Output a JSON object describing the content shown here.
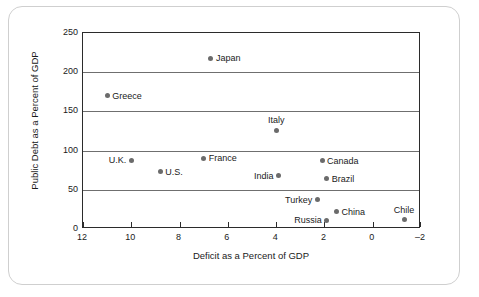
{
  "chart_data": {
    "type": "scatter",
    "title": "",
    "xlabel": "Deficit as a Percent of GDP",
    "ylabel": "Public Debt as a Percent of GDP",
    "xlim": [
      12,
      -2
    ],
    "ylim": [
      0,
      250
    ],
    "x_ticks": [
      "12",
      "10",
      "8",
      "6",
      "4",
      "2",
      "0",
      "–2"
    ],
    "x_tick_values": [
      12,
      10,
      8,
      6,
      4,
      2,
      0,
      -2
    ],
    "y_ticks": [
      "250",
      "200",
      "150",
      "100",
      "50",
      "0"
    ],
    "y_tick_values": [
      250,
      200,
      150,
      100,
      50,
      0
    ],
    "grid": "horizontal",
    "legend": "none",
    "x_axis_reversed": true,
    "marker_color": "#6b6b6b",
    "points": [
      {
        "label": "Japan",
        "x": 6.7,
        "y": 218,
        "label_pos": "right"
      },
      {
        "label": "Greece",
        "x": 11.0,
        "y": 170,
        "label_pos": "right"
      },
      {
        "label": "Italy",
        "x": 4.0,
        "y": 126,
        "label_pos": "above"
      },
      {
        "label": "U.K.",
        "x": 10.0,
        "y": 88,
        "label_pos": "left"
      },
      {
        "label": "France",
        "x": 7.0,
        "y": 90,
        "label_pos": "right"
      },
      {
        "label": "Canada",
        "x": 2.1,
        "y": 87,
        "label_pos": "right"
      },
      {
        "label": "U.S.",
        "x": 8.8,
        "y": 73,
        "label_pos": "right"
      },
      {
        "label": "India",
        "x": 3.9,
        "y": 68,
        "label_pos": "left"
      },
      {
        "label": "Brazil",
        "x": 1.9,
        "y": 64,
        "label_pos": "right"
      },
      {
        "label": "Turkey",
        "x": 2.3,
        "y": 37,
        "label_pos": "left"
      },
      {
        "label": "China",
        "x": 1.5,
        "y": 22,
        "label_pos": "right"
      },
      {
        "label": "Russia",
        "x": 1.9,
        "y": 11,
        "label_pos": "left"
      },
      {
        "label": "Chile",
        "x": -1.3,
        "y": 12,
        "label_pos": "above"
      }
    ]
  }
}
